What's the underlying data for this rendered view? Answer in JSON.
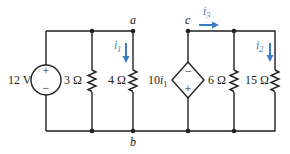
{
  "circuit": {
    "voltage_source": {
      "label": "12 V",
      "plus": "+",
      "minus": "−"
    },
    "resistors": [
      {
        "id": "R3",
        "label": "3 Ω"
      },
      {
        "id": "R4",
        "label": "4 Ω"
      },
      {
        "id": "R6",
        "label": "6 Ω"
      },
      {
        "id": "R15",
        "label": "15 Ω"
      }
    ],
    "dependent_source": {
      "label_coef": "10",
      "label_var": "i",
      "label_sub": "1",
      "top": "−",
      "bottom": "+"
    },
    "nodes": {
      "a": "a",
      "b": "b",
      "c": "c"
    },
    "currents": [
      {
        "id": "i1",
        "var": "i",
        "sub": "1"
      },
      {
        "id": "i2",
        "var": "i",
        "sub": "2"
      },
      {
        "id": "i3",
        "var": "i",
        "sub": "3"
      }
    ],
    "colors": {
      "wire": "#231f20",
      "current_arrow": "#3a7cc2"
    }
  }
}
